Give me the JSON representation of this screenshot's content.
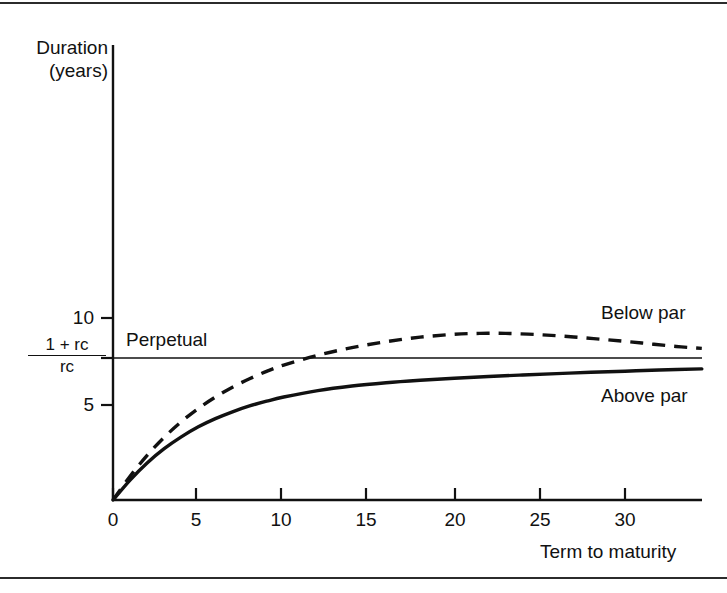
{
  "figure": {
    "frame_color": "#2b2b2b",
    "background": "#ffffff",
    "ink_color": "#111111"
  },
  "axes": {
    "y_title_line1": "Duration",
    "y_title_line2": "(years)",
    "x_title": "Term to maturity",
    "y_tick_10": "10",
    "y_tick_5": "5",
    "y_tick_fraction_numerator": "1 + rc",
    "y_tick_fraction_denominator": "rc"
  },
  "annotations": {
    "perpetual": "Perpetual",
    "below_par": "Below par",
    "above_par": "Above par"
  },
  "chart_data": {
    "type": "line",
    "title": "",
    "xlabel": "Term to maturity",
    "ylabel": "Duration (years)",
    "xlim": [
      0,
      35.3
    ],
    "ylim": [
      0,
      15.8
    ],
    "grid": false,
    "legend": "inline-right-labels",
    "x_ticks": [
      0,
      5,
      10,
      15,
      20,
      25,
      30
    ],
    "x_tick_labels": [
      "0",
      "5",
      "10",
      "15",
      "20",
      "25",
      "30"
    ],
    "y_ticks": [
      5,
      7.6,
      10
    ],
    "y_tick_labels": [
      "5",
      "(1 + rc)/rc",
      "10"
    ],
    "series": [
      {
        "name": "Above par",
        "style": "solid",
        "color": "#111111",
        "x": [
          0,
          1,
          2,
          3,
          4,
          5,
          6,
          7,
          8,
          9,
          10,
          12,
          14,
          16,
          18,
          20,
          22,
          24,
          26,
          28,
          30,
          32,
          34.5
        ],
        "y": [
          0.0,
          1.05,
          1.95,
          2.7,
          3.32,
          3.85,
          4.28,
          4.64,
          4.95,
          5.2,
          5.42,
          5.76,
          6.0,
          6.17,
          6.3,
          6.41,
          6.5,
          6.58,
          6.65,
          6.72,
          6.78,
          6.84,
          6.9
        ]
      },
      {
        "name": "Below par",
        "style": "dashed",
        "color": "#111111",
        "x": [
          0,
          1,
          2,
          3,
          4,
          5,
          6,
          7,
          8,
          9,
          10,
          12,
          14,
          16,
          18,
          20,
          21.5,
          23,
          25,
          27,
          29,
          31,
          33,
          34.5
        ],
        "y": [
          0.0,
          1.25,
          2.35,
          3.3,
          4.12,
          4.82,
          5.42,
          5.94,
          6.38,
          6.77,
          7.1,
          7.62,
          8.02,
          8.33,
          8.57,
          8.72,
          8.77,
          8.77,
          8.7,
          8.58,
          8.43,
          8.26,
          8.08,
          7.98
        ]
      },
      {
        "name": "Perpetual",
        "style": "solid-horizontal",
        "color": "#111111",
        "x": [
          0,
          35.3
        ],
        "y": [
          7.6,
          7.6
        ]
      }
    ]
  }
}
